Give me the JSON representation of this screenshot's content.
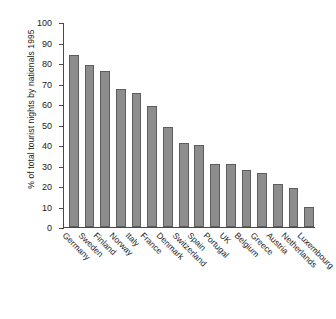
{
  "chart_data": {
    "type": "bar",
    "title": "",
    "subtitle": "",
    "xlabel": "",
    "ylabel": "% of total tourist nights by nationals 1995",
    "ylim": [
      0,
      100
    ],
    "ytick_labels": [
      "100",
      "90",
      "80",
      "70",
      "60",
      "50",
      "40",
      "30",
      "20",
      "10",
      "0"
    ],
    "ytick_values": [
      100,
      90,
      80,
      70,
      60,
      50,
      40,
      30,
      20,
      10,
      0
    ],
    "grid": false,
    "legend": null,
    "legend_position": "none",
    "bar_color": "#8d8d8d",
    "bar_edge_color": "#5d5d5d",
    "axis_color": "#4a4a4a",
    "categories": [
      "Germany",
      "Sweden",
      "Finland",
      "Norway",
      "Italy",
      "France",
      "Denmark",
      "Switzerland",
      "Spain",
      "Portugal",
      "UK",
      "Belgium",
      "Greece",
      "Austria",
      "Netherlands",
      "Luxembourg"
    ],
    "values": [
      84.5,
      79.5,
      76.5,
      67.5,
      65.5,
      59.5,
      49,
      41,
      40,
      31,
      31,
      28,
      26.5,
      21,
      19,
      10
    ]
  }
}
